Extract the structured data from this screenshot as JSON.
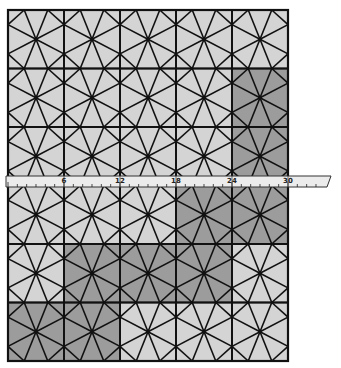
{
  "figure": {
    "colors": {
      "light_fill": "#d4d4d4",
      "dark_fill": "#9c9c9c",
      "line": "#111111",
      "ruler_fill": "#ececec"
    },
    "grid": {
      "x0": 8,
      "y0": 10,
      "cell_w": 56,
      "cell_h": 58.5,
      "cols": 5,
      "rows": 6
    },
    "dark_cells": [
      [
        4,
        1
      ],
      [
        4,
        2
      ],
      [
        3,
        3
      ],
      [
        4,
        3
      ],
      [
        1,
        4
      ],
      [
        2,
        4
      ],
      [
        3,
        4
      ],
      [
        0,
        5
      ],
      [
        1,
        5
      ]
    ]
  },
  "ruler": {
    "labels": [
      "6",
      "12",
      "18",
      "24",
      "30"
    ],
    "unit_px": 9.333,
    "zero_x": 8,
    "y": 176,
    "height": 11,
    "x_start": 6,
    "x_end": 331
  }
}
